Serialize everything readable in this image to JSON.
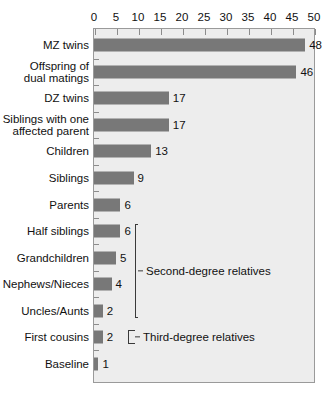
{
  "chart_data": {
    "type": "bar",
    "orientation": "horizontal",
    "title": "",
    "xlabel": "",
    "ylabel": "",
    "xlim": [
      0,
      50
    ],
    "xticks": [
      0,
      5,
      10,
      15,
      20,
      25,
      30,
      35,
      40,
      45,
      50
    ],
    "grid": false,
    "legend": null,
    "categories": [
      "MZ twins",
      "Offspring of\ndual matings",
      "DZ twins",
      "Siblings with one\naffected parent",
      "Children",
      "Siblings",
      "Parents",
      "Half siblings",
      "Grandchildren",
      "Nephews/Nieces",
      "Uncles/Aunts",
      "First cousins",
      "Baseline"
    ],
    "values": [
      48,
      46,
      17,
      17,
      13,
      9,
      6,
      6,
      5,
      4,
      2,
      2,
      1
    ],
    "value_labels": [
      "48",
      "46",
      "17",
      "17",
      "13",
      "9",
      "6",
      "6",
      "5",
      "4",
      "2",
      "2",
      "1"
    ],
    "annotations": [
      {
        "text": "Second-degree relatives",
        "covers": [
          "Half siblings",
          "Grandchildren",
          "Nephews/Nieces",
          "Uncles/Aunts"
        ]
      },
      {
        "text": "Third-degree relatives",
        "covers": [
          "First cousins"
        ]
      }
    ],
    "colors": {
      "bar": "#787878",
      "plot_background": "#ededed",
      "page_background": "#ffffff",
      "axis": "#9a9a9a",
      "text": "#111111",
      "bracket": "#3a3a3a"
    }
  }
}
